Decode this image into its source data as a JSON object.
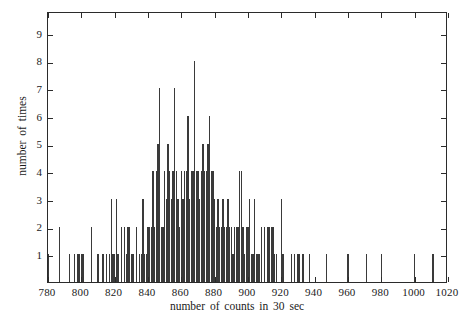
{
  "chart_data": {
    "type": "bar",
    "title": "",
    "subtitle": "",
    "xlabel": "number of counts in 30 sec",
    "ylabel": "number of times",
    "xlim": [
      780,
      1020
    ],
    "ylim": [
      0,
      9.8
    ],
    "grid": false,
    "legend": null,
    "bin_width": 1,
    "xticks": [
      780,
      800,
      820,
      840,
      860,
      880,
      900,
      920,
      940,
      960,
      980,
      1000,
      1020
    ],
    "xtick_labels": [
      "780",
      "800",
      "820",
      "840",
      "860",
      "880",
      "900",
      "920",
      "940",
      "960",
      "980",
      "1000",
      "1020"
    ],
    "yticks": [
      1,
      2,
      3,
      4,
      5,
      6,
      7,
      8,
      9
    ],
    "ytick_labels": [
      "1",
      "2",
      "3",
      "4",
      "5",
      "6",
      "7",
      "8",
      "9"
    ],
    "bar_color": "#3a3a3a",
    "axis_color": "#2b2b2b",
    "x": [
      780,
      787,
      793,
      796,
      798,
      799,
      800,
      801,
      806,
      810,
      813,
      815,
      817,
      818,
      819,
      820,
      821,
      822,
      824,
      826,
      827,
      828,
      829,
      830,
      831,
      833,
      835,
      836,
      837,
      838,
      839,
      840,
      841,
      842,
      843,
      844,
      845,
      846,
      847,
      848,
      849,
      850,
      851,
      852,
      853,
      854,
      855,
      856,
      857,
      858,
      859,
      860,
      861,
      862,
      863,
      864,
      865,
      866,
      867,
      868,
      869,
      870,
      871,
      872,
      873,
      874,
      875,
      876,
      877,
      878,
      879,
      880,
      881,
      882,
      883,
      884,
      885,
      886,
      887,
      888,
      889,
      890,
      891,
      892,
      893,
      894,
      895,
      896,
      897,
      898,
      899,
      900,
      901,
      902,
      903,
      904,
      905,
      906,
      907,
      908,
      910,
      912,
      913,
      914,
      915,
      916,
      917,
      920,
      921,
      926,
      928,
      930,
      931,
      933,
      937,
      947,
      960,
      971,
      980,
      1000,
      1011
    ],
    "y": [
      1,
      2,
      1,
      1,
      1,
      1,
      1,
      1,
      2,
      1,
      1,
      1,
      1,
      3,
      1,
      1,
      3,
      1,
      2,
      2,
      1,
      2,
      2,
      1,
      1,
      2,
      1,
      1,
      3,
      1,
      1,
      2,
      2,
      2,
      4,
      2,
      4,
      5,
      7,
      2,
      2,
      4,
      3,
      5,
      4,
      3,
      4,
      7,
      4,
      3,
      2,
      4,
      3,
      4,
      4,
      6,
      3,
      4,
      4,
      8,
      4,
      4,
      3,
      4,
      5,
      4,
      4,
      5,
      6,
      4,
      4,
      3,
      2,
      3,
      2,
      2,
      3,
      2,
      2,
      3,
      2,
      2,
      1,
      2,
      2,
      2,
      4,
      4,
      2,
      1,
      2,
      2,
      3,
      1,
      1,
      3,
      1,
      1,
      1,
      2,
      2,
      2,
      2,
      2,
      2,
      1,
      1,
      3,
      1,
      1,
      1,
      1,
      1,
      1,
      1,
      1,
      1,
      1,
      1,
      1,
      1
    ]
  },
  "axes": {
    "xlabel": "number of counts in 30 sec",
    "ylabel": "number of times"
  }
}
